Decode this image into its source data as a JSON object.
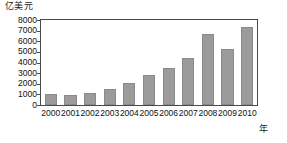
{
  "chart_data": {
    "type": "bar",
    "title": "",
    "subtitle": "",
    "xlabel": "年",
    "ylabel": "亿美元",
    "categories": [
      "2000",
      "2001",
      "2002",
      "2003",
      "2004",
      "2005",
      "2006",
      "2007",
      "2008",
      "2009",
      "2010"
    ],
    "values": [
      1000,
      950,
      1150,
      1500,
      2100,
      2800,
      3500,
      4400,
      6700,
      5300,
      7300
    ],
    "ylim": [
      0,
      8000
    ],
    "y_ticks": [
      0,
      1000,
      2000,
      3000,
      4000,
      5000,
      6000,
      7000,
      8000
    ],
    "y_tick_labels": [
      "0",
      "1000",
      "2000",
      "3000",
      "4000",
      "5000",
      "6000",
      "7000",
      "8000"
    ],
    "grid": false,
    "legend": false,
    "legend_position": "none",
    "series": [
      {
        "name": "",
        "values": [
          1000,
          950,
          1150,
          1500,
          2100,
          2800,
          3500,
          4400,
          6700,
          5300,
          7300
        ]
      }
    ],
    "colors": {
      "bar_fill": "#9b9b9b",
      "bar_stroke": "#8a8a8a",
      "axis": "#4a4a4a",
      "text": "#111111",
      "background": "#ffffff"
    }
  }
}
